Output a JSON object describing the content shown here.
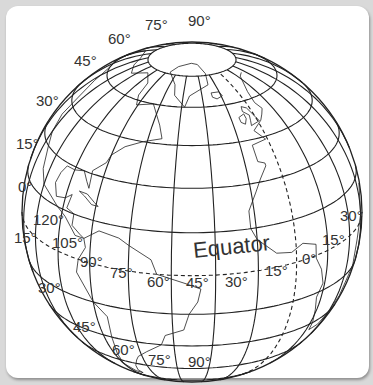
{
  "figure": {
    "type": "orthographic globe with latitude/longitude graticule",
    "view_center": {
      "lat": 22,
      "lon": -38
    },
    "colors": {
      "background": "#d9d9d9",
      "card": "#ffffff",
      "lines": "#222222",
      "labels": "#333333"
    },
    "equator_label": "Equator",
    "latitude_labels_left": [
      {
        "text": "75°",
        "x": 145,
        "y": 30
      },
      {
        "text": "90°",
        "x": 188,
        "y": 26
      },
      {
        "text": "60°",
        "x": 108,
        "y": 44
      },
      {
        "text": "45°",
        "x": 74,
        "y": 66
      },
      {
        "text": "30°",
        "x": 36,
        "y": 106
      },
      {
        "text": "15°",
        "x": 16,
        "y": 149
      },
      {
        "text": "0°",
        "x": 18,
        "y": 192
      },
      {
        "text": "15°",
        "x": 14,
        "y": 243
      },
      {
        "text": "30°",
        "x": 38,
        "y": 293
      },
      {
        "text": "45°",
        "x": 73,
        "y": 332
      },
      {
        "text": "60°",
        "x": 112,
        "y": 355
      },
      {
        "text": "75°",
        "x": 148,
        "y": 365
      },
      {
        "text": "90°",
        "x": 188,
        "y": 367
      }
    ],
    "longitude_labels": [
      {
        "text": "120°",
        "x": 33,
        "y": 225
      },
      {
        "text": "105°",
        "x": 52,
        "y": 248
      },
      {
        "text": "90°",
        "x": 80,
        "y": 267
      },
      {
        "text": "75°",
        "x": 110,
        "y": 278
      },
      {
        "text": "60°",
        "x": 147,
        "y": 287
      },
      {
        "text": "45°",
        "x": 186,
        "y": 288
      },
      {
        "text": "30°",
        "x": 225,
        "y": 287
      },
      {
        "text": "15°",
        "x": 265,
        "y": 276
      },
      {
        "text": "0°",
        "x": 302,
        "y": 264
      },
      {
        "text": "15°",
        "x": 322,
        "y": 245
      },
      {
        "text": "30°",
        "x": 340,
        "y": 221
      }
    ],
    "equator_text_pos": {
      "x": 194,
      "y": 258,
      "rotate": -6
    }
  }
}
